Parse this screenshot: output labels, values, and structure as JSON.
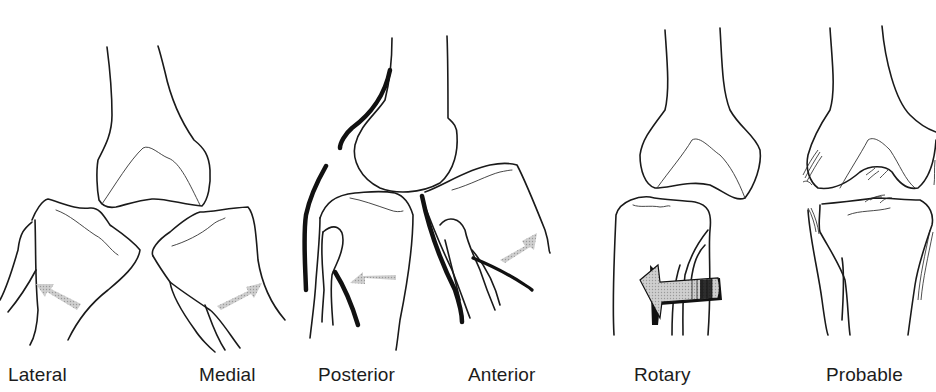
{
  "figure": {
    "panels": [
      {
        "id": "lateral-medial",
        "labels": [
          "Lateral",
          "Medial"
        ]
      },
      {
        "id": "posterior-anterior",
        "labels": [
          "Posterior",
          "Anterior"
        ]
      },
      {
        "id": "rotary",
        "labels": [
          "Rotary"
        ]
      },
      {
        "id": "probable",
        "labels": [
          "Probable"
        ]
      }
    ]
  },
  "labels": {
    "lateral": "Lateral",
    "medial": "Medial",
    "posterior": "Posterior",
    "anterior": "Anterior",
    "rotary": "Rotary",
    "probable": "Probable"
  },
  "colors": {
    "line": "#1a1a1a",
    "arrow_fill": "#b8b8b8",
    "rotary_arrow_fill": "#c4c4c4",
    "background": "#ffffff"
  },
  "icons": {
    "lateral_arrow": "arrow-up-left-icon",
    "medial_arrow": "arrow-up-right-icon",
    "posterior_arrow": "arrow-left-icon",
    "anterior_arrow": "arrow-up-right-icon",
    "rotary_arrow": "curved-arrow-left-icon"
  }
}
